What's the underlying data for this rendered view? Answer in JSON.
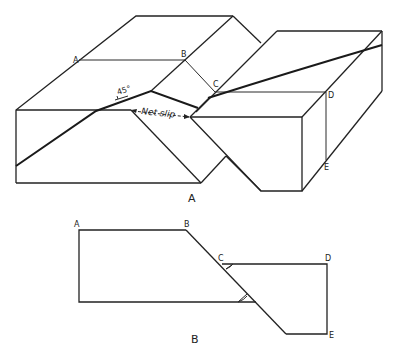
{
  "figure_a": {
    "caption": "A",
    "labels": {
      "A": "A",
      "B": "B",
      "C": "C",
      "D": "D",
      "E": "E"
    },
    "dip_angle": "45°",
    "net_slip_label": "Net slip"
  },
  "figure_b": {
    "caption": "B",
    "labels": {
      "A": "A",
      "B": "B",
      "C": "C",
      "D": "D",
      "E": "E"
    }
  },
  "colors": {
    "line": "#222222",
    "background": "#ffffff"
  }
}
